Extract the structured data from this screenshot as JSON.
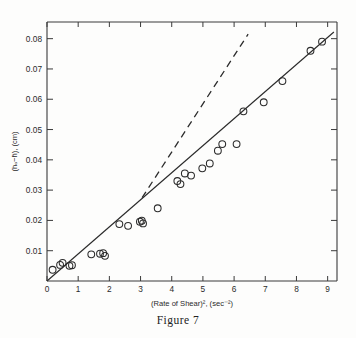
{
  "caption": "Figure 7",
  "chart_data": {
    "type": "scatter",
    "title": "",
    "subtitle": "",
    "xlabel": "(Rate of Shear)², (sec⁻²)",
    "ylabel": "(hₒ−h̄), (cm)",
    "xlim": [
      0,
      9.3
    ],
    "ylim": [
      0,
      0.0855
    ],
    "grid": false,
    "legend": null,
    "xticks": [
      0,
      1,
      2,
      3,
      4,
      5,
      6,
      7,
      8,
      9
    ],
    "xticklabels": [
      "0",
      "1",
      "2",
      "3",
      "4",
      "5",
      "6",
      "7",
      "8",
      "9"
    ],
    "yticks": [
      0.01,
      0.02,
      0.03,
      0.04,
      0.05,
      0.06,
      0.07,
      0.08
    ],
    "yticklabels": [
      "0.01",
      "0.02",
      "0.03",
      "0.04",
      "0.05",
      "0.06",
      "0.07",
      "0.08"
    ],
    "marker": "open-circle",
    "points": [
      {
        "x": 0.18,
        "y": 0.0037
      },
      {
        "x": 0.42,
        "y": 0.0053
      },
      {
        "x": 0.5,
        "y": 0.006
      },
      {
        "x": 0.72,
        "y": 0.005
      },
      {
        "x": 0.8,
        "y": 0.0052
      },
      {
        "x": 1.42,
        "y": 0.0088
      },
      {
        "x": 1.7,
        "y": 0.009
      },
      {
        "x": 1.8,
        "y": 0.0092
      },
      {
        "x": 1.86,
        "y": 0.0083
      },
      {
        "x": 2.32,
        "y": 0.0188
      },
      {
        "x": 2.6,
        "y": 0.0182
      },
      {
        "x": 2.98,
        "y": 0.0196
      },
      {
        "x": 3.04,
        "y": 0.0199
      },
      {
        "x": 3.08,
        "y": 0.019
      },
      {
        "x": 3.55,
        "y": 0.024
      },
      {
        "x": 4.18,
        "y": 0.033
      },
      {
        "x": 4.28,
        "y": 0.032
      },
      {
        "x": 4.42,
        "y": 0.0355
      },
      {
        "x": 4.62,
        "y": 0.0348
      },
      {
        "x": 4.98,
        "y": 0.0372
      },
      {
        "x": 5.22,
        "y": 0.0388
      },
      {
        "x": 5.48,
        "y": 0.043
      },
      {
        "x": 5.62,
        "y": 0.0452
      },
      {
        "x": 6.08,
        "y": 0.0452
      },
      {
        "x": 6.3,
        "y": 0.056
      },
      {
        "x": 6.95,
        "y": 0.059
      },
      {
        "x": 7.55,
        "y": 0.066
      },
      {
        "x": 8.45,
        "y": 0.076
      },
      {
        "x": 8.82,
        "y": 0.079
      }
    ],
    "fit_line": {
      "name": "fitted line",
      "style": "solid",
      "x": [
        0.0,
        9.2
      ],
      "y": [
        0.0,
        0.0822
      ]
    },
    "reference_line": {
      "name": "extrapolated tangent",
      "style": "dashed",
      "x": [
        3.05,
        6.45
      ],
      "y": [
        0.0275,
        0.0815
      ]
    }
  }
}
